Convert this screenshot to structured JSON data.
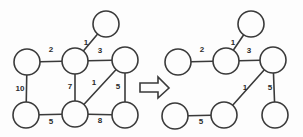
{
  "diagram": {
    "canvas": {
      "width": 303,
      "height": 137
    },
    "colors": {
      "background": "#fdfdfd",
      "stroke": "#3a3a3a",
      "node_fill": "#fdfdfd",
      "label_text": "#2b2b2b"
    },
    "arrow": {
      "icon": "right-arrow-icon",
      "label": "transforms to"
    },
    "left_graph": {
      "caption": "weighted-graph",
      "nodes": [
        {
          "id": "L-top",
          "cx": 106,
          "cy": 24,
          "r": 13
        },
        {
          "id": "L-upleft",
          "cx": 27,
          "cy": 62,
          "r": 13
        },
        {
          "id": "L-center",
          "cx": 75,
          "cy": 61,
          "r": 13
        },
        {
          "id": "L-upright",
          "cx": 125,
          "cy": 60,
          "r": 13
        },
        {
          "id": "L-lowleft",
          "cx": 26,
          "cy": 115,
          "r": 13
        },
        {
          "id": "L-lowmid",
          "cx": 75,
          "cy": 114,
          "r": 13
        },
        {
          "id": "L-lowright",
          "cx": 125,
          "cy": 115,
          "r": 13
        }
      ],
      "edges": [
        {
          "from": "L-center",
          "to": "L-top",
          "weight": "1",
          "lx": 86,
          "ly": 43
        },
        {
          "from": "L-upleft",
          "to": "L-center",
          "weight": "2",
          "lx": 51,
          "ly": 50
        },
        {
          "from": "L-center",
          "to": "L-upright",
          "weight": "3",
          "lx": 100,
          "ly": 51
        },
        {
          "from": "L-upleft",
          "to": "L-lowleft",
          "weight": "10",
          "lx": 20,
          "ly": 89
        },
        {
          "from": "L-center",
          "to": "L-lowmid",
          "weight": "7",
          "lx": 70,
          "ly": 87
        },
        {
          "from": "L-upright",
          "to": "L-lowmid",
          "weight": "1",
          "lx": 94,
          "ly": 83
        },
        {
          "from": "L-upright",
          "to": "L-lowright",
          "weight": "5",
          "lx": 118,
          "ly": 87
        },
        {
          "from": "L-lowleft",
          "to": "L-lowmid",
          "weight": "5",
          "lx": 51,
          "ly": 122
        },
        {
          "from": "L-lowmid",
          "to": "L-lowright",
          "weight": "8",
          "lx": 100,
          "ly": 121
        }
      ]
    },
    "right_graph": {
      "caption": "minimum-spanning-tree",
      "nodes": [
        {
          "id": "R-top",
          "cx": 251,
          "cy": 24,
          "r": 13
        },
        {
          "id": "R-upleft",
          "cx": 178,
          "cy": 62,
          "r": 13
        },
        {
          "id": "R-center",
          "cx": 226,
          "cy": 61,
          "r": 13
        },
        {
          "id": "R-upright",
          "cx": 273,
          "cy": 60,
          "r": 13
        },
        {
          "id": "R-lowleft",
          "cx": 175,
          "cy": 116,
          "r": 13
        },
        {
          "id": "R-lowmid",
          "cx": 224,
          "cy": 115,
          "r": 13
        },
        {
          "id": "R-lowright",
          "cx": 275,
          "cy": 115,
          "r": 13
        }
      ],
      "edges": [
        {
          "from": "R-center",
          "to": "R-top",
          "weight": "1",
          "lx": 233,
          "ly": 43
        },
        {
          "from": "R-upleft",
          "to": "R-center",
          "weight": "2",
          "lx": 202,
          "ly": 50
        },
        {
          "from": "R-center",
          "to": "R-upright",
          "weight": "3",
          "lx": 249,
          "ly": 51
        },
        {
          "from": "R-upright",
          "to": "R-lowmid",
          "weight": "1",
          "lx": 245,
          "ly": 88
        },
        {
          "from": "R-upright",
          "to": "R-lowright",
          "weight": "5",
          "lx": 270,
          "ly": 88
        },
        {
          "from": "R-lowleft",
          "to": "R-lowmid",
          "weight": "5",
          "lx": 201,
          "ly": 122
        }
      ]
    }
  }
}
